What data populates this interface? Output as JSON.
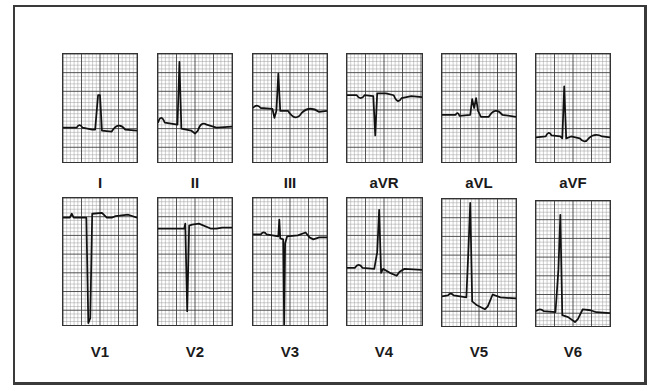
{
  "figure": {
    "type": "12-lead ECG",
    "rows": [
      {
        "leads": [
          "I",
          "II",
          "III",
          "aVR",
          "aVL",
          "aVF"
        ]
      },
      {
        "leads": [
          "V1",
          "V2",
          "V3",
          "V4",
          "V5",
          "V6"
        ]
      }
    ]
  },
  "leads": [
    {
      "label": "I",
      "x": 62,
      "y": 53,
      "w": 76,
      "h": 110,
      "trace": "M0,75 L14,75 Q17,70 20,75 L30,77 L33,77 L36,42 L38,42 L40,78 L50,79 Q57,68 64,77 L76,78"
    },
    {
      "label": "II",
      "x": 157,
      "y": 53,
      "w": 76,
      "h": 110,
      "trace": "M0,70 Q3,60 7,70 L20,72 L22,8 L24,76 L34,78 L38,81 L41,78 Q44,68 50,72 L60,75 L76,74"
    },
    {
      "label": "III",
      "x": 252,
      "y": 53,
      "w": 76,
      "h": 110,
      "trace": "M0,55 Q4,50 8,55 L20,56 L22,65 L24,58 L26,20 L28,58 L36,58 Q44,70 50,60 Q58,52 68,59 L76,58"
    },
    {
      "label": "aVR",
      "x": 346,
      "y": 53,
      "w": 77,
      "h": 110,
      "trace": "M0,42 L10,42 Q14,48 18,42 L27,43 L29,83 L31,40 L40,40 L48,42 Q52,52 56,45 L66,43 L77,44"
    },
    {
      "label": "aVL",
      "x": 441,
      "y": 53,
      "w": 76,
      "h": 110,
      "trace": "M0,62 L14,62 Q16,58 18,63 L29,62 L31,46 L33,55 L35,45 L37,58 L40,64 L48,64 Q55,53 62,62 L76,64"
    },
    {
      "label": "aVF",
      "x": 535,
      "y": 53,
      "w": 76,
      "h": 110,
      "trace": "M0,85 L10,84 Q13,77 16,83 L25,84 L27,86 L29,33 L31,86 L36,84 L45,86 Q50,92 54,86 Q60,80 68,84 L76,85"
    },
    {
      "label": "V1",
      "x": 62,
      "y": 197,
      "w": 76,
      "h": 129,
      "trace": "M0,20 L7,20 L9,16 L11,20 L24,20 L26,127 L28,122 L30,16 L40,15 L45,20 L50,20 Q54,18 58,18 L67,17 L76,20"
    },
    {
      "label": "V2",
      "x": 157,
      "y": 197,
      "w": 76,
      "h": 129,
      "trace": "M0,31 L27,31 L28,26 L30,115 L32,28 L35,27 L42,26 L54,31 L60,31 L66,30 L76,30"
    },
    {
      "label": "V3",
      "x": 252,
      "y": 197,
      "w": 76,
      "h": 129,
      "trace": "M0,37 L8,37 Q11,33 14,37 L26,39 L27,22 L28,41 L31,42 L32,129 L33,46 L35,39 L46,38 L54,35 L58,40 L62,42 L68,40 L76,40"
    },
    {
      "label": "V4",
      "x": 346,
      "y": 197,
      "w": 77,
      "h": 129,
      "trace": "M0,71 L8,71 Q12,65 16,71 L28,72 L31,55 L33,12 L35,76 L37,72 L44,76 L51,79 L54,75 L59,72 L77,73"
    },
    {
      "label": "V5",
      "x": 441,
      "y": 198,
      "w": 76,
      "h": 129,
      "trace": "M0,99 L6,98 Q9,94 12,98 L25,100 L27,55 L29,4 L31,104 L36,108 L44,112 L47,109 L52,97 L60,100 L76,101"
    },
    {
      "label": "V6",
      "x": 535,
      "y": 200,
      "w": 76,
      "h": 127,
      "trace": "M0,112 Q4,108 8,112 L20,113 L23,70 L25,14 L27,116 L33,118 L40,123 L43,120 L48,110 L56,111 L62,113 L76,114"
    }
  ],
  "colors": {
    "grid_minor": "#9a9a9a",
    "grid_major": "#3c3c3c",
    "trace": "#111111",
    "border": "#3a3a3a"
  }
}
